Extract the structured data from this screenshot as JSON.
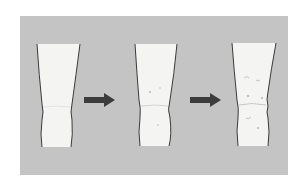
{
  "diagram": {
    "colors": {
      "background": "#ffffff",
      "panel": "#c4c4c4",
      "leg_fill": "#f4f4f2",
      "outline": "#3a3a3a",
      "arrow": "#3c3c3c"
    },
    "stages": [
      {
        "id": "stage-1",
        "state": "smooth knee"
      },
      {
        "id": "stage-2",
        "state": "slightly swollen knee with faint marks"
      },
      {
        "id": "stage-3",
        "state": "irregular swollen knee with more marks"
      }
    ],
    "arrows": [
      {
        "from": "stage-1",
        "to": "stage-2"
      },
      {
        "from": "stage-2",
        "to": "stage-3"
      }
    ]
  }
}
